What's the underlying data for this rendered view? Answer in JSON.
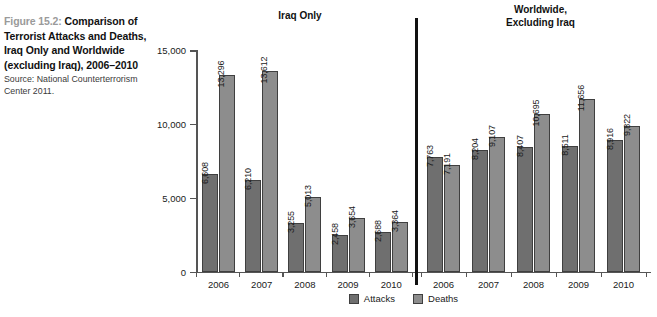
{
  "caption": {
    "figure_label": "Figure 15.2:",
    "title": "Comparison of Terrorist Attacks and Deaths, Iraq Only and Worldwide (excluding Iraq), 2006–2010",
    "source": "Source: National Counterterrorism Center 2011."
  },
  "panels": {
    "left_heading": "Iraq Only",
    "right_heading_line1": "Worldwide,",
    "right_heading_line2": "Excluding Iraq"
  },
  "legend": {
    "items": [
      {
        "label": "Attacks",
        "color": "#6f6f6f"
      },
      {
        "label": "Deaths",
        "color": "#8d8d8d"
      }
    ]
  },
  "axis": {
    "y_ticks": [
      "15,000",
      "10,000",
      "5,000",
      "0"
    ],
    "y_tick_values": [
      15000,
      10000,
      5000,
      0
    ]
  },
  "chart_data": {
    "type": "bar",
    "title": "Comparison of Terrorist Attacks and Deaths, Iraq Only and Worldwide (excluding Iraq), 2006–2010",
    "subtitle": "",
    "xlabel": "",
    "ylabel": "",
    "ylim": [
      0,
      15000
    ],
    "yticks": [
      0,
      5000,
      10000,
      15000
    ],
    "grid": false,
    "legend_position": "bottom-center",
    "panels": [
      {
        "name": "Iraq Only",
        "categories": [
          "2006",
          "2007",
          "2008",
          "2009",
          "2010"
        ],
        "series": [
          {
            "name": "Attacks",
            "values": [
              6608,
              6210,
              3255,
              2458,
              2688
            ],
            "labels": [
              "6,608",
              "6,210",
              "3,255",
              "2,458",
              "2,688"
            ]
          },
          {
            "name": "Deaths",
            "values": [
              13296,
              13612,
              5013,
              3654,
              3364
            ],
            "labels": [
              "13,296",
              "13,612",
              "5,013",
              "3,654",
              "3,364"
            ]
          }
        ]
      },
      {
        "name": "Worldwide, Excluding Iraq",
        "categories": [
          "2006",
          "2007",
          "2008",
          "2009",
          "2010"
        ],
        "series": [
          {
            "name": "Attacks",
            "values": [
              7763,
              8204,
              8407,
              8511,
              8916
            ],
            "labels": [
              "7,763",
              "8,204",
              "8,407",
              "8,511",
              "8,916"
            ]
          },
          {
            "name": "Deaths",
            "values": [
              7191,
              9107,
              10695,
              11656,
              9822
            ],
            "labels": [
              "7,191",
              "9,107",
              "10,695",
              "11,656",
              "9,822"
            ]
          }
        ]
      }
    ]
  }
}
